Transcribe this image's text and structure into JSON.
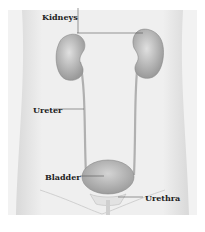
{
  "diagram": {
    "labels": {
      "kidneys": "Kidneys",
      "ureter": "Ureter",
      "bladder": "Bladder",
      "urethra": "Urethra"
    },
    "colors": {
      "body": "#ececec",
      "body_edge": "#d6d6d6",
      "organ": "#bdbdbd",
      "organ_dark": "#8f8f8f",
      "line": "#555555"
    }
  }
}
